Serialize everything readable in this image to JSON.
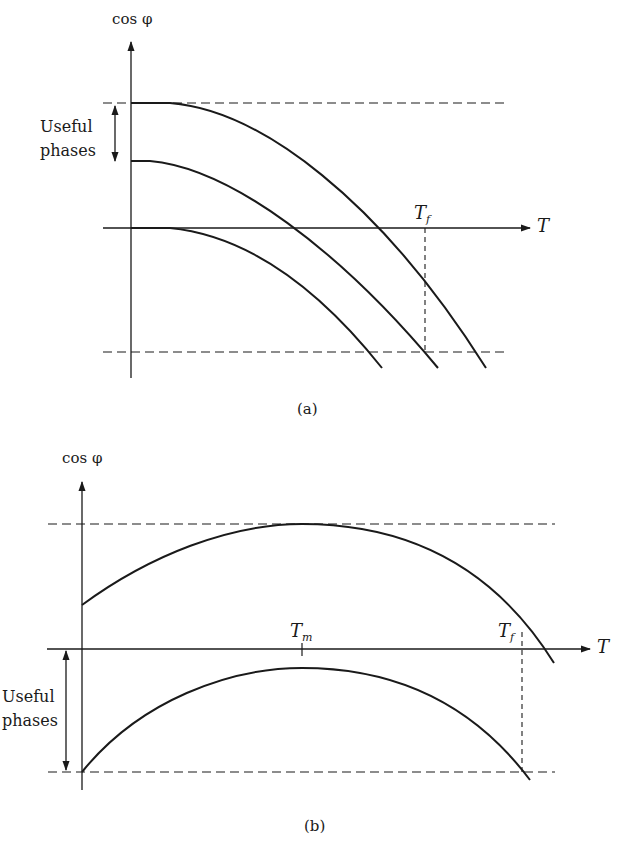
{
  "figure_a": {
    "caption": "(a)",
    "y_axis_label": "cos φ",
    "x_axis_label": "T",
    "marker_label": {
      "main": "T",
      "sub": "f"
    },
    "annotation": {
      "line1": "Useful",
      "line2": "phases"
    },
    "curves": [
      "upper curve",
      "middle curve",
      "lower curve"
    ]
  },
  "figure_b": {
    "caption": "(b)",
    "y_axis_label": "cos φ",
    "x_axis_label": "T",
    "marker_m": {
      "main": "T",
      "sub": "m"
    },
    "marker_f": {
      "main": "T",
      "sub": "f"
    },
    "annotation": {
      "line1": "Useful",
      "line2": "phases"
    },
    "curves": [
      "upper curve",
      "lower curve"
    ]
  },
  "colors": {
    "ink": "#1a1a1a",
    "background": "#ffffff"
  }
}
